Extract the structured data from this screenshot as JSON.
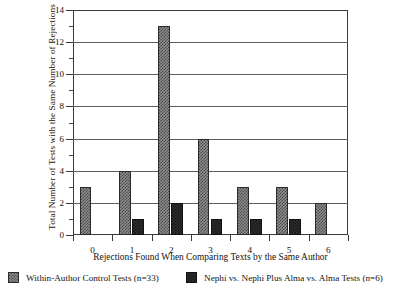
{
  "chart_data": {
    "type": "bar",
    "title": "",
    "xlabel": "Rejections Found When Comparing Texts by the Same Author",
    "ylabel": "Total Number of Tests with the Same Number of Rejections",
    "categories": [
      "0",
      "1",
      "2",
      "3",
      "4",
      "5",
      "6"
    ],
    "series": [
      {
        "name": "Within-Author Control Tests (n=33)",
        "fill": "light-checkered",
        "values": [
          3,
          4,
          13,
          6,
          3,
          3,
          2
        ]
      },
      {
        "name": "Nephi vs. Nephi Plus Alma vs. Alma Tests (n=6)",
        "fill": "dark-solid",
        "values": [
          0,
          1,
          2,
          1,
          1,
          1,
          0
        ]
      }
    ],
    "ylim": [
      0,
      14
    ],
    "ytick_labels": [
      "0",
      "2",
      "4",
      "6",
      "8",
      "10",
      "12",
      "14"
    ],
    "ytick_values": [
      0,
      2,
      4,
      6,
      8,
      10,
      12,
      14
    ],
    "yminor_values": [
      1,
      3,
      5,
      7,
      9,
      11,
      13
    ],
    "grid": "horizontal",
    "legend_position": "bottom",
    "colors": {
      "series1_fill": "#8d8d8d",
      "series1_pattern": "#4a4a4a",
      "series2_fill": "#2f2f2f",
      "series2_pattern": "#121212",
      "axis": "#3a3a3a",
      "gridline": "#5d5d5d",
      "background": "#ffffff",
      "text": "#141414"
    }
  },
  "legend": {
    "entries": [
      {
        "label": "Within-Author Control Tests (n=33)"
      },
      {
        "label": "Nephi vs. Nephi Plus Alma vs. Alma Tests (n=6)"
      }
    ]
  }
}
